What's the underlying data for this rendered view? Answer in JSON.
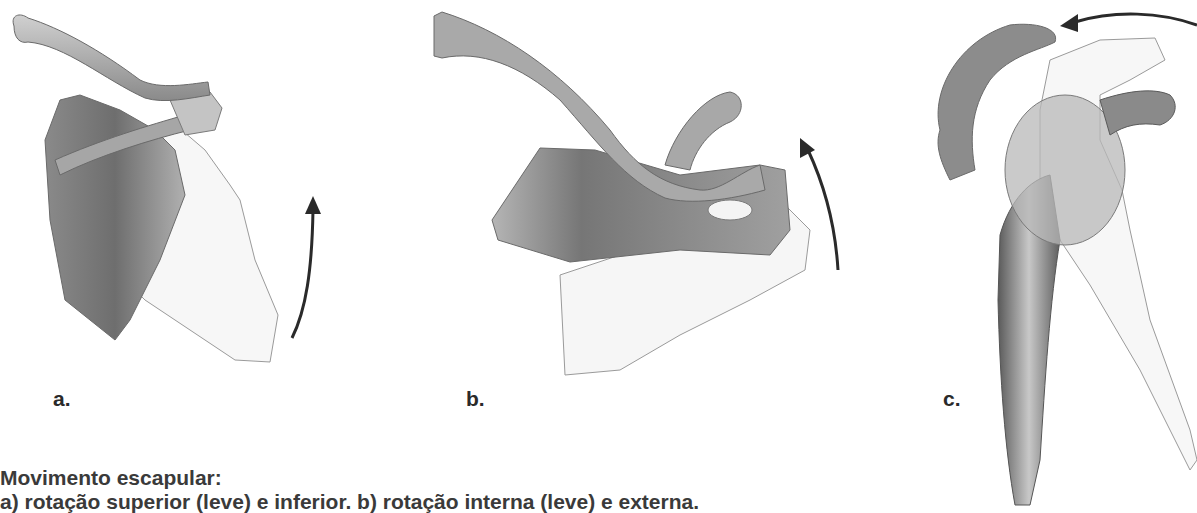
{
  "figure": {
    "panels": [
      {
        "id": "a",
        "label": "a.",
        "movement": "upward-rotation",
        "arrow_direction": "up"
      },
      {
        "id": "b",
        "label": "b.",
        "movement": "internal-external-rotation",
        "arrow_direction": "up"
      },
      {
        "id": "c",
        "label": "c.",
        "movement": "tilt",
        "arrow_direction": "left"
      }
    ],
    "colors": {
      "bone_dark": "#6e6e6e",
      "bone_mid": "#9a9a9a",
      "bone_light": "#c8c8c8",
      "ghost_outline": "#8a8a8a",
      "arrow": "#2a2a2a",
      "text": "#3a3a3a"
    }
  },
  "caption": {
    "title": "Movimento escapular:",
    "body": "a) rotação superior (leve) e inferior. b) rotação interna (leve) e externa."
  }
}
